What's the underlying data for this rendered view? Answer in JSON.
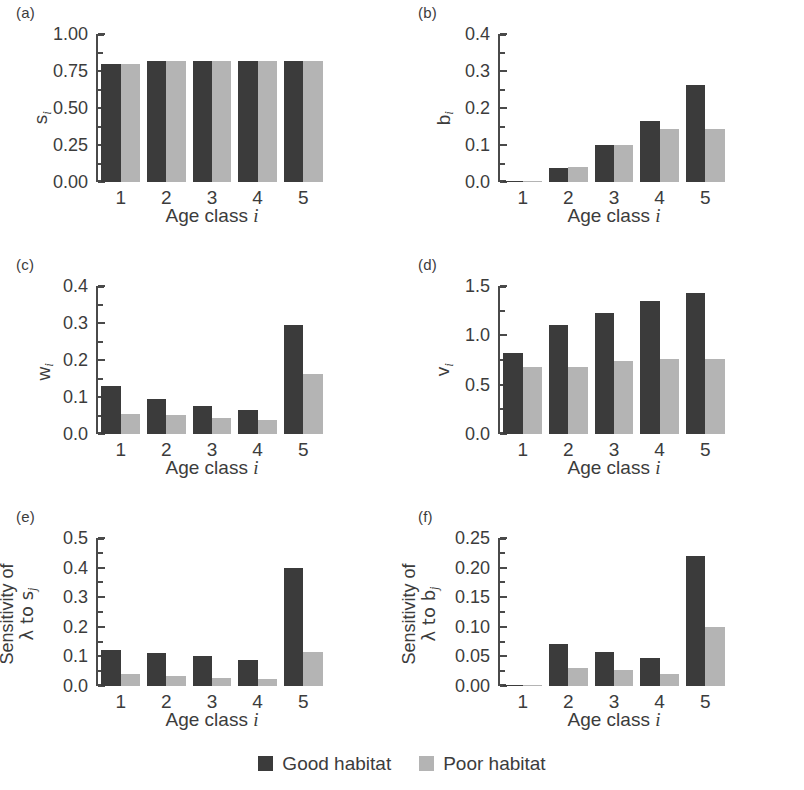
{
  "figure": {
    "xtitle": "Age class",
    "xtitle_italic": "i",
    "categories": [
      "1",
      "2",
      "3",
      "4",
      "5"
    ]
  },
  "legend": {
    "items": [
      {
        "label": "Good habitat",
        "color": "#3b3b3b",
        "key": "good"
      },
      {
        "label": "Poor habitat",
        "color": "#b4b4b4",
        "key": "poor"
      }
    ]
  },
  "panels": [
    {
      "letter": "(a)",
      "ylabel": "s",
      "ysub": "i"
    },
    {
      "letter": "(b)",
      "ylabel": "b",
      "ysub": "i"
    },
    {
      "letter": "(c)",
      "ylabel": "w",
      "ysub": "i"
    },
    {
      "letter": "(d)",
      "ylabel": "v",
      "ysub": "i"
    },
    {
      "letter": "(e)",
      "ylabel_line1": "Sensitivity of",
      "ylabel_line2": "λ to s",
      "ysub": "j"
    },
    {
      "letter": "(f)",
      "ylabel_line1": "Sensitivity of",
      "ylabel_line2": "λ to b",
      "ysub": "j"
    }
  ],
  "chart_data": [
    {
      "panel": "(a)",
      "type": "bar",
      "title": "",
      "xlabel": "Age class i",
      "ylabel": "s_i",
      "categories": [
        "1",
        "2",
        "3",
        "4",
        "5"
      ],
      "ylim": [
        0,
        1.0
      ],
      "yticks": [
        0.0,
        0.25,
        0.5,
        0.75,
        1.0
      ],
      "yticklabels": [
        "0.00",
        "0.25",
        "0.50",
        "0.75",
        "1.00"
      ],
      "grid": false,
      "legend_position": "bottom-center",
      "series": [
        {
          "name": "Good habitat",
          "values": [
            0.8,
            0.82,
            0.82,
            0.82,
            0.82
          ]
        },
        {
          "name": "Poor habitat",
          "values": [
            0.8,
            0.82,
            0.82,
            0.82,
            0.82
          ]
        }
      ]
    },
    {
      "panel": "(b)",
      "type": "bar",
      "title": "",
      "xlabel": "Age class i",
      "ylabel": "b_i",
      "categories": [
        "1",
        "2",
        "3",
        "4",
        "5"
      ],
      "ylim": [
        0,
        0.4
      ],
      "yticks": [
        0.0,
        0.1,
        0.2,
        0.3,
        0.4
      ],
      "yticklabels": [
        "0.0",
        "0.1",
        "0.2",
        "0.3",
        "0.4"
      ],
      "grid": false,
      "legend_position": "bottom-center",
      "series": [
        {
          "name": "Good habitat",
          "values": [
            0.0,
            0.038,
            0.1,
            0.165,
            0.262
          ]
        },
        {
          "name": "Poor habitat",
          "values": [
            0.0,
            0.04,
            0.099,
            0.142,
            0.143
          ]
        }
      ]
    },
    {
      "panel": "(c)",
      "type": "bar",
      "title": "",
      "xlabel": "Age class i",
      "ylabel": "w_i",
      "categories": [
        "1",
        "2",
        "3",
        "4",
        "5"
      ],
      "ylim": [
        0,
        0.4
      ],
      "yticks": [
        0.0,
        0.1,
        0.2,
        0.3,
        0.4
      ],
      "yticklabels": [
        "0.0",
        "0.1",
        "0.2",
        "0.3",
        "0.4"
      ],
      "grid": false,
      "legend_position": "bottom-center",
      "series": [
        {
          "name": "Good habitat",
          "values": [
            0.13,
            0.095,
            0.077,
            0.065,
            0.295
          ]
        },
        {
          "name": "Poor habitat",
          "values": [
            0.053,
            0.052,
            0.043,
            0.037,
            0.163
          ]
        }
      ]
    },
    {
      "panel": "(d)",
      "type": "bar",
      "title": "",
      "xlabel": "Age class i",
      "ylabel": "v_i",
      "categories": [
        "1",
        "2",
        "3",
        "4",
        "5"
      ],
      "ylim": [
        0,
        1.5
      ],
      "yticks": [
        0.0,
        0.5,
        1.0,
        1.5
      ],
      "yticklabels": [
        "0.0",
        "0.5",
        "1.0",
        "1.5"
      ],
      "grid": false,
      "legend_position": "bottom-center",
      "series": [
        {
          "name": "Good habitat",
          "values": [
            0.82,
            1.1,
            1.23,
            1.35,
            1.43
          ]
        },
        {
          "name": "Poor habitat",
          "values": [
            0.68,
            0.68,
            0.74,
            0.76,
            0.76
          ]
        }
      ]
    },
    {
      "panel": "(e)",
      "type": "bar",
      "title": "",
      "xlabel": "Age class i",
      "ylabel": "Sensitivity of lambda to s_j",
      "categories": [
        "1",
        "2",
        "3",
        "4",
        "5"
      ],
      "ylim": [
        0,
        0.5
      ],
      "yticks": [
        0.0,
        0.1,
        0.2,
        0.3,
        0.4,
        0.5
      ],
      "yticklabels": [
        "0.0",
        "0.1",
        "0.2",
        "0.3",
        "0.4",
        "0.5"
      ],
      "grid": false,
      "legend_position": "bottom-center",
      "series": [
        {
          "name": "Good habitat",
          "values": [
            0.12,
            0.11,
            0.1,
            0.088,
            0.4
          ]
        },
        {
          "name": "Poor habitat",
          "values": [
            0.04,
            0.033,
            0.027,
            0.025,
            0.115
          ]
        }
      ]
    },
    {
      "panel": "(f)",
      "type": "bar",
      "title": "",
      "xlabel": "Age class i",
      "ylabel": "Sensitivity of lambda to b_j",
      "categories": [
        "1",
        "2",
        "3",
        "4",
        "5"
      ],
      "ylim": [
        0,
        0.25
      ],
      "yticks": [
        0.0,
        0.05,
        0.1,
        0.15,
        0.2,
        0.25
      ],
      "yticklabels": [
        "0.00",
        "0.05",
        "0.10",
        "0.15",
        "0.20",
        "0.25"
      ],
      "grid": false,
      "legend_position": "bottom-center",
      "series": [
        {
          "name": "Good habitat",
          "values": [
            0.002,
            0.071,
            0.058,
            0.047,
            0.22
          ]
        },
        {
          "name": "Poor habitat",
          "values": [
            0.002,
            0.031,
            0.027,
            0.021,
            0.1
          ]
        }
      ]
    }
  ]
}
